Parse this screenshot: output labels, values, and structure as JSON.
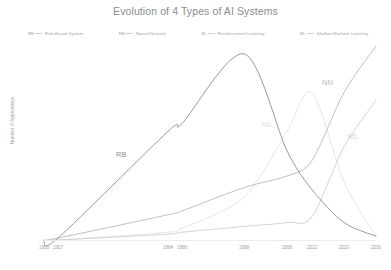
{
  "title": "Evolution of 4 Types of AI Systems",
  "legend": {
    "items": [
      {
        "key": "RB",
        "label": "Rule-Based System",
        "color": "#8e8e8e"
      },
      {
        "key": "NN",
        "label": "Neural Network",
        "color": "#b9b9b9"
      },
      {
        "key": "RL",
        "label": "Reinforcement Learning",
        "color": "#cecece"
      },
      {
        "key": "ML",
        "label": "Shallow Machine Learning",
        "color": "#e2e2e2"
      }
    ]
  },
  "axes": {
    "ylabel": "Number of Applications",
    "xticks": [
      "1956",
      "1957",
      "1984",
      "1986",
      "1998",
      "2006",
      "2012",
      "2020",
      "2030"
    ]
  },
  "series_labels": {
    "rb": "RB",
    "nn": "NN",
    "rl": "RL",
    "ml": "ML"
  },
  "chart_data": {
    "type": "line",
    "title": "Evolution of 4 Types of AI Systems",
    "xlabel": "",
    "ylabel": "Number of Applications",
    "grid": false,
    "legend_position": "top",
    "x": [
      1956,
      1957,
      1984,
      1986,
      1998,
      2006,
      2012,
      2020,
      2030
    ],
    "xlim": [
      1956,
      2030
    ],
    "ylim": [
      0,
      100
    ],
    "series": [
      {
        "name": "Rule-Based System",
        "key": "RB",
        "color": "#8e8e8e",
        "values": [
          0,
          1,
          56,
          60,
          96,
          46,
          26,
          9,
          2
        ]
      },
      {
        "name": "Neural Network",
        "key": "NN",
        "color": "#b9b9b9",
        "values": [
          0,
          1,
          13,
          15,
          27,
          33,
          41,
          76,
          100
        ]
      },
      {
        "name": "Reinforcement Learning",
        "key": "RL",
        "color": "#cecece",
        "values": [
          0,
          0,
          3,
          4,
          7,
          9,
          12,
          48,
          72
        ]
      },
      {
        "name": "Shallow Machine Learning",
        "key": "ML",
        "color": "#e2e2e2",
        "values": [
          0,
          0,
          4,
          6,
          22,
          56,
          76,
          30,
          2
        ]
      }
    ]
  }
}
